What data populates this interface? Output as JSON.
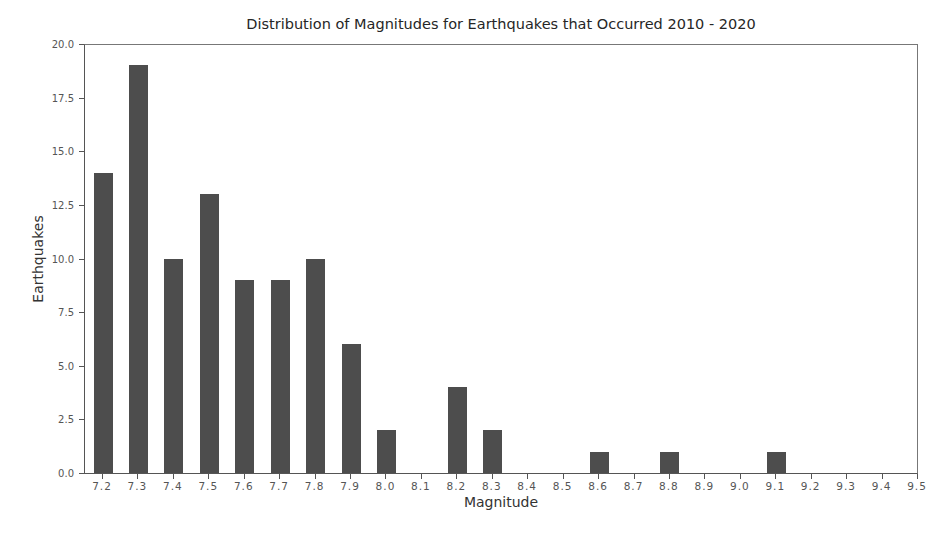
{
  "chart_data": {
    "type": "bar",
    "title": "Distribution of Magnitudes for Earthquakes that Occurred 2010 - 2020",
    "xlabel": "Magnitude",
    "ylabel": "Earthquakes",
    "categories": [
      "7.2",
      "7.3",
      "7.4",
      "7.5",
      "7.6",
      "7.7",
      "7.8",
      "7.9",
      "8.0",
      "8.1",
      "8.2",
      "8.3",
      "8.4",
      "8.5",
      "8.6",
      "8.7",
      "8.8",
      "8.9",
      "9.0",
      "9.1",
      "9.2",
      "9.3",
      "9.4",
      "9.5"
    ],
    "values": [
      14,
      19,
      10,
      13,
      9,
      9,
      10,
      6,
      2,
      0,
      4,
      2,
      0,
      0,
      1,
      0,
      1,
      0,
      0,
      1,
      0,
      0,
      0,
      0
    ],
    "ylim": [
      0,
      20
    ],
    "yticks": [
      "0.0",
      "2.5",
      "5.0",
      "7.5",
      "10.0",
      "12.5",
      "15.0",
      "17.5",
      "20.0"
    ],
    "grid": false,
    "legend": null,
    "bar_color": "#4d4d4d"
  }
}
